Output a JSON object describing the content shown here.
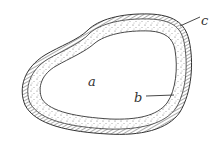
{
  "diagram": {
    "labels": {
      "a": "a",
      "b": "b",
      "c": "c"
    },
    "colors": {
      "line": "#333333",
      "stipple": "#555555",
      "background": "#ffffff"
    }
  }
}
